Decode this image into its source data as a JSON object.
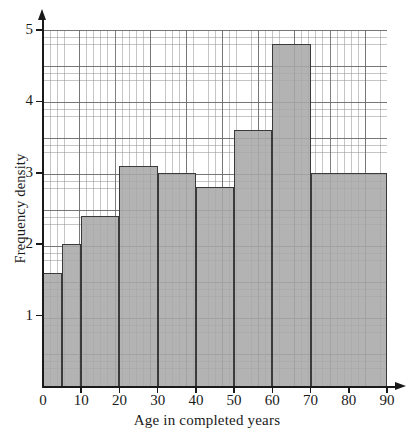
{
  "chart_data": {
    "type": "bar",
    "title": "",
    "xlabel": "Age in completed years",
    "ylabel": "Frequency density",
    "xlim": [
      0,
      90
    ],
    "ylim": [
      0,
      5
    ],
    "grid": true,
    "legend": "none",
    "x_ticks": [
      "0",
      "10",
      "20",
      "30",
      "40",
      "50",
      "60",
      "70",
      "80",
      "90"
    ],
    "x_tick_values": [
      0,
      10,
      20,
      30,
      40,
      50,
      60,
      70,
      80,
      90
    ],
    "y_ticks": [
      "1",
      "2",
      "3",
      "4",
      "5"
    ],
    "y_tick_values": [
      1,
      2,
      3,
      4,
      5
    ],
    "bin_edges": [
      0,
      5,
      10,
      20,
      30,
      40,
      50,
      60,
      70,
      90
    ],
    "categories": [
      "0-5",
      "5-10",
      "10-20",
      "20-30",
      "30-40",
      "40-50",
      "50-60",
      "60-70",
      "70-90"
    ],
    "values": [
      1.6,
      2.0,
      2.4,
      3.1,
      3.0,
      2.8,
      3.6,
      4.8,
      3.0
    ],
    "bar_fill_color": "#a8a8a8",
    "bar_edge_color": "#3a3a3a",
    "grid_color": "#969696",
    "axis_color": "#1a1a1a"
  }
}
